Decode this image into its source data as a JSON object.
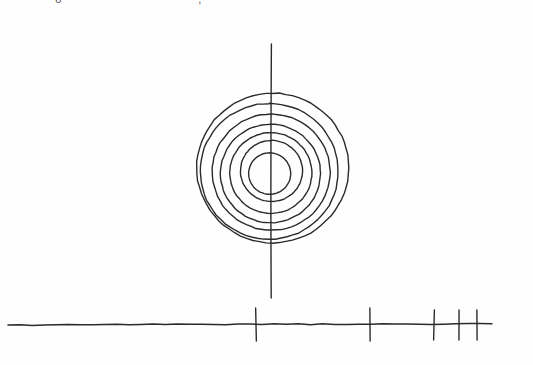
{
  "page": {
    "background_color": "#fefefe",
    "ink_color": "#2b2b2b",
    "width": 533,
    "height": 365
  },
  "clipped_header": {
    "fragment_left": "o",
    "fragment_right": ",",
    "note": "partially cropped text at very top edge of image"
  },
  "chart_data": {
    "type": "diagram",
    "title": "",
    "subtitle": "",
    "xlabel": "",
    "ylabel": "",
    "grid": false,
    "legend_position": "none",
    "style": "hand-drawn line art, black ink on white paper",
    "concentric_rings": {
      "count": 7,
      "center": {
        "x": 271,
        "y": 172
      },
      "radii_px": [
        76,
        69,
        59,
        50,
        41,
        31,
        21
      ],
      "stroke_width": 1.4,
      "note": "nested circles, slightly irregular / hand-drawn, centers drift a few px between rings"
    },
    "vertical_axis": {
      "x": 271,
      "y_top": 44,
      "y_bottom": 298,
      "stroke_width": 1.4,
      "label": ""
    },
    "horizontal_axis": {
      "y": 325,
      "x_start": 8,
      "x_end": 492,
      "stroke_width": 1.5,
      "label": "",
      "tick_marks": [
        {
          "x": 256,
          "y_top": 308,
          "y_bottom": 341,
          "label": ""
        },
        {
          "x": 370,
          "y_top": 308,
          "y_bottom": 341,
          "label": ""
        },
        {
          "x": 434,
          "y_top": 310,
          "y_bottom": 340,
          "label": ""
        },
        {
          "x": 459,
          "y_top": 310,
          "y_bottom": 340,
          "label": ""
        },
        {
          "x": 477,
          "y_top": 310,
          "y_bottom": 340,
          "label": ""
        }
      ],
      "tick_count": 5,
      "tick_spacing_note": "ticks crowd together toward the right end, suggesting a logarithmic / compressed scale"
    }
  }
}
